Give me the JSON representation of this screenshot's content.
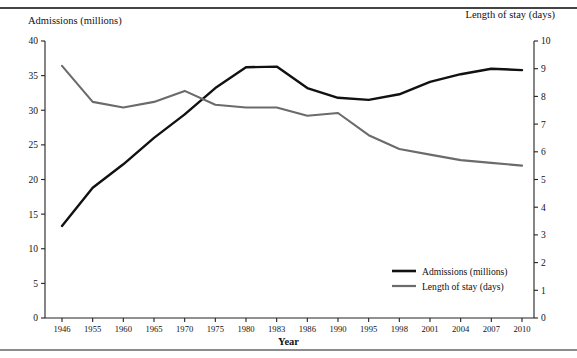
{
  "figure": {
    "top_rule": "rule",
    "bottom_rule": "rule"
  },
  "axes": {
    "left_title": "Admissions (millions)",
    "right_title": "Length of stay (days)",
    "x_title": "Year"
  },
  "legend": {
    "position": "inside-bottom-right",
    "items": [
      {
        "label": "Admissions (millions)",
        "color": "#111111"
      },
      {
        "label": "Length of stay (days)",
        "color": "#6b6b6b"
      }
    ]
  },
  "chart_data": {
    "type": "line",
    "title": "",
    "subtitle": "",
    "xlabel": "Year",
    "categories": [
      "1946",
      "1955",
      "1960",
      "1965",
      "1970",
      "1975",
      "1980",
      "1983",
      "1986",
      "1990",
      "1995",
      "1998",
      "2001",
      "2004",
      "2007",
      "2010"
    ],
    "grid": false,
    "legend_position": "inside-bottom-right",
    "axes": [
      {
        "side": "left",
        "label": "Admissions (millions)",
        "ylim": [
          0,
          40
        ],
        "ticks": [
          0,
          5,
          10,
          15,
          20,
          25,
          30,
          35,
          40
        ]
      },
      {
        "side": "right",
        "label": "Length of stay (days)",
        "ylim": [
          0,
          10
        ],
        "ticks": [
          0,
          1,
          2,
          3,
          4,
          5,
          6,
          7,
          8,
          9,
          10
        ]
      }
    ],
    "series": [
      {
        "name": "Admissions (millions)",
        "axis": "left",
        "color": "#111111",
        "values": [
          13.3,
          18.8,
          22.2,
          26.0,
          29.4,
          33.2,
          36.2,
          36.3,
          33.2,
          31.8,
          31.5,
          32.3,
          34.1,
          35.2,
          36.0,
          35.8
        ]
      },
      {
        "name": "Length of stay (days)",
        "axis": "right",
        "color": "#6b6b6b",
        "values": [
          9.1,
          7.8,
          7.6,
          7.8,
          8.2,
          7.7,
          7.6,
          7.6,
          7.3,
          7.4,
          6.6,
          6.1,
          5.9,
          5.7,
          5.6,
          5.5
        ]
      }
    ]
  }
}
